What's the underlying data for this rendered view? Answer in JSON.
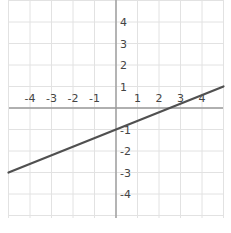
{
  "chart_data": {
    "type": "line",
    "title": "",
    "xlabel": "",
    "ylabel": "",
    "xlim": [
      -5,
      5
    ],
    "ylim": [
      -5,
      5
    ],
    "grid": true,
    "x_ticks": [
      "-4",
      "-3",
      "-2",
      "-1",
      "1",
      "2",
      "3",
      "4"
    ],
    "y_ticks": [
      "4",
      "3",
      "2",
      "1",
      "-1",
      "-2",
      "-3",
      "-4"
    ],
    "series": [
      {
        "name": "line",
        "equation": "y = 0.4x - 1",
        "slope": 0.4,
        "intercept": -1,
        "x": [
          -5,
          5
        ],
        "y": [
          -3,
          1
        ],
        "color": "#505050"
      }
    ]
  },
  "colors": {
    "grid": "#e2e2e2",
    "axis": "#9a9a9a",
    "line": "#505050",
    "text": "#444444"
  }
}
